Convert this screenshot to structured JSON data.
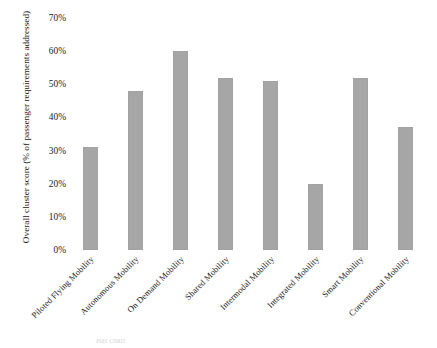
{
  "chart_data": {
    "type": "bar",
    "title": "",
    "xlabel": "",
    "ylabel": "Overall cluster score (% of passenger requirements addressed)",
    "ylim": [
      0,
      70
    ],
    "grid": false,
    "legend": null,
    "bar_color": "#a6a6a6",
    "y_ticks": [
      "0%",
      "10%",
      "20%",
      "30%",
      "40%",
      "50%",
      "60%",
      "70%"
    ],
    "y_tick_values": [
      0,
      10,
      20,
      30,
      40,
      50,
      60,
      70
    ],
    "categories": [
      "Piloted Flying Mobility",
      "Autonomous Mobility",
      "On Demand Mobility",
      "Shared Mobility",
      "Intermodal Mobility",
      "Integrated Mobility",
      "Smart Mobility",
      "Conventional Mobility"
    ],
    "values": [
      31,
      48,
      60,
      52,
      51,
      20,
      52,
      37
    ],
    "value_labels": [
      "31%",
      "48%",
      "60%",
      "52%",
      "51%",
      "20%",
      "52%",
      "37%"
    ]
  },
  "caption": {
    "partial_text": "Bar chart"
  }
}
